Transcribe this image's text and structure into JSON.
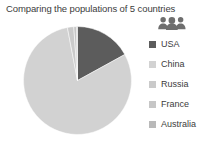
{
  "chart_title": "Comparing the populations of 5 countries",
  "legend": {
    "icon_name": "people-group-icon",
    "icon_color": "#6e6e6e",
    "items": [
      {
        "label": "USA",
        "color": "#5c5c5c"
      },
      {
        "label": "China",
        "color": "#d2d2d2"
      },
      {
        "label": "Russia",
        "color": "#cacaca"
      },
      {
        "label": "France",
        "color": "#c6c6c6"
      },
      {
        "label": "Australia",
        "color": "#b9b9b9"
      }
    ]
  },
  "chart_data": {
    "type": "pie",
    "title": "Comparing the populations of 5 countries",
    "xlabel": "",
    "ylabel": "",
    "legend_position": "right",
    "grid": false,
    "start_angle_deg": 0,
    "direction": "clockwise",
    "categories": [
      "USA",
      "China",
      "Russia",
      "France",
      "Australia"
    ],
    "values": [
      17.0,
      80.0,
      1.9,
      0.8,
      0.3
    ],
    "units": "percent",
    "slices": [
      {
        "label": "USA",
        "percent": 17.0,
        "color": "#5c5c5c"
      },
      {
        "label": "China",
        "percent": 80.0,
        "color": "#d2d2d2"
      },
      {
        "label": "Russia",
        "percent": 1.9,
        "color": "#cacaca"
      },
      {
        "label": "France",
        "percent": 0.8,
        "color": "#c6c6c6"
      },
      {
        "label": "Australia",
        "percent": 0.3,
        "color": "#b9b9b9"
      }
    ]
  },
  "geometry": {
    "center_x": 55.5,
    "center_y": 55.5,
    "radius": 54
  }
}
